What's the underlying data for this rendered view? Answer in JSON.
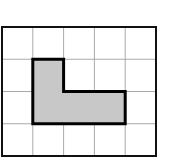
{
  "diagram": {
    "type": "grid-figure",
    "columns": 5,
    "rows": 4,
    "grid_color": "#aaaaaa",
    "border_color": "#111111",
    "shape": {
      "name": "L-shape",
      "fill_color": "#c8c8c8",
      "stroke_color": "#000000",
      "cells": [
        [
          1,
          1
        ],
        [
          1,
          2
        ],
        [
          2,
          2
        ],
        [
          3,
          2
        ]
      ]
    }
  }
}
